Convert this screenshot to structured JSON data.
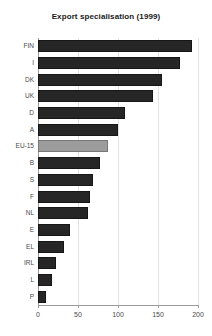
{
  "chart_data": {
    "type": "bar",
    "orientation": "horizontal",
    "title": "Export specialisation (1999)",
    "xlabel": "",
    "ylabel": "",
    "xlim": [
      0,
      200
    ],
    "ylim": null,
    "grid": true,
    "grid_axis": "x",
    "legend": null,
    "xticks": [
      0,
      50,
      100,
      150,
      200
    ],
    "xtick_labels": [
      "0",
      "50",
      "100",
      "150",
      "200"
    ],
    "categories": [
      "FIN",
      "I",
      "DK",
      "UK",
      "D",
      "A",
      "EU-15",
      "B",
      "S",
      "F",
      "NL",
      "E",
      "EL",
      "IRL",
      "L",
      "P"
    ],
    "values": [
      192,
      178,
      155,
      144,
      109,
      100,
      88,
      78,
      69,
      65,
      62,
      40,
      33,
      22,
      17,
      10
    ],
    "colors": {
      "bar": "#262626",
      "bar_edge": "#161616",
      "highlight_bar": "#9c9c9c",
      "highlight_bar_edge": "#777777",
      "grid": "#e2e2e2",
      "axis": "#9b9b9b",
      "title": "#1a1a1a",
      "tick_label": "#4a4a4a",
      "background": "#ffffff"
    },
    "highlighted_category": "EU-15",
    "annotations": []
  }
}
